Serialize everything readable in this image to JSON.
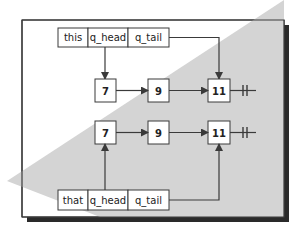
{
  "diagram": {
    "type": "linked-list-queue-copy",
    "colors": {
      "background": "#ffffff",
      "shade": "#d4d4d4",
      "stroke": "#3a3a3a",
      "shadow": "#2a2a2a",
      "box_fill": "#ffffff"
    },
    "top_queue": {
      "cells": [
        "this",
        "q_head",
        "q_tail"
      ]
    },
    "bottom_queue": {
      "cells": [
        "that",
        "q_head",
        "q_tail"
      ]
    },
    "list_top": {
      "nodes": [
        "7",
        "9",
        "11"
      ],
      "terminator": "null-terminator"
    },
    "list_bottom": {
      "nodes": [
        "7",
        "9",
        "11"
      ],
      "terminator": "null-terminator"
    }
  }
}
